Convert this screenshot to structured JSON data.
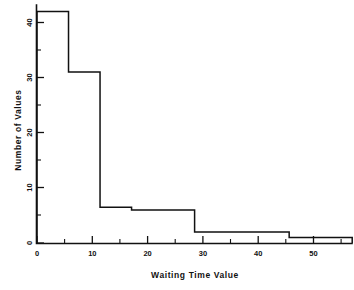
{
  "chart_data": {
    "type": "bar",
    "title": "",
    "xlabel": "Waiting Time Value",
    "ylabel": "Number of Values",
    "xlim": [
      0,
      58
    ],
    "ylim": [
      0,
      44
    ],
    "grid": false,
    "legend": null,
    "style": "step-outline histogram",
    "x_ticks_major": [
      0,
      10,
      20,
      30,
      40,
      50
    ],
    "x_tick_labels": [
      "0",
      "10",
      "20",
      "30",
      "40",
      "50"
    ],
    "x_ticks_minor": [
      5,
      15,
      25,
      35,
      45,
      55
    ],
    "y_ticks_major": [
      0,
      10,
      20,
      30,
      40
    ],
    "y_tick_labels": [
      "0",
      "10",
      "20",
      "30",
      "40"
    ],
    "y_ticks_minor": [
      5,
      15,
      25,
      35
    ],
    "bin_edges": [
      0,
      5.7,
      11.4,
      17.1,
      28.5,
      45.6,
      51.3,
      57.0
    ],
    "values": [
      42,
      31,
      6.5,
      6,
      2,
      1,
      1
    ],
    "bars": [
      {
        "left": 0.0,
        "right": 5.7,
        "height": 42
      },
      {
        "left": 5.7,
        "right": 11.4,
        "height": 31
      },
      {
        "left": 11.4,
        "right": 17.1,
        "height": 6.5
      },
      {
        "left": 17.1,
        "right": 28.5,
        "height": 6
      },
      {
        "left": 28.5,
        "right": 45.6,
        "height": 2
      },
      {
        "left": 45.6,
        "right": 51.3,
        "height": 1
      },
      {
        "left": 51.3,
        "right": 57.0,
        "height": 1
      }
    ],
    "axis_color": "#111111",
    "line_color": "#111111",
    "background": "#ffffff"
  }
}
